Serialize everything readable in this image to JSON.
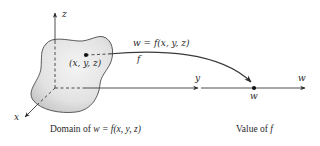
{
  "diagram": {
    "domain_axes": {
      "z_label": "z",
      "y_label": "y",
      "x_label": "x"
    },
    "point_label": "(x, y, z)",
    "mapping": {
      "formula_label": "w = f(x, y, z)",
      "function_label": "f"
    },
    "value_axis": {
      "axis_label": "w",
      "point_label": "w"
    },
    "captions": {
      "domain_prefix": "Domain of ",
      "domain_formula": "w = f(x, y, z)",
      "value_prefix": "Value of ",
      "value_f": "f"
    },
    "colors": {
      "region_fill_light": "#f2f2f2",
      "region_fill_dark": "#c9c9c9",
      "stroke": "#3a3a3a"
    }
  }
}
